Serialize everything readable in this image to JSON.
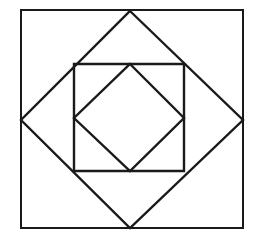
{
  "figure": {
    "background_color": "#ffffff",
    "ink_color": "#1a1a1a",
    "canvas": {
      "width": 259,
      "height": 248
    },
    "shapes": [
      {
        "name": "outer-square",
        "type": "polygon",
        "label": "Outer square",
        "stroke_width": 2.0,
        "points": "21,10 243,10 243,228 21,228"
      },
      {
        "name": "outer-diamond",
        "type": "polygon",
        "label": "Inscribed diamond (rotated square)",
        "stroke_width": 2.4,
        "points": "130,11 243,120 130,228 21,120"
      },
      {
        "name": "inner-square",
        "type": "polygon",
        "label": "Second axis-aligned square",
        "stroke_width": 2.4,
        "points": "74,64 184,64 184,171 74,171"
      },
      {
        "name": "inner-diamond",
        "type": "polygon",
        "label": "Innermost diamond (rotated square)",
        "stroke_width": 2.4,
        "points": "130,64 184,118 130,171 74,118"
      }
    ],
    "vertices": {
      "outer_square": {
        "top_left": "21,10",
        "top_right": "243,10",
        "bottom_right": "243,228",
        "bottom_left": "21,228"
      },
      "outer_diamond": {
        "top": "130,11",
        "right": "243,120",
        "bottom": "130,228",
        "left": "21,120"
      },
      "inner_square": {
        "top_left": "74,64",
        "top_right": "184,64",
        "bottom_right": "184,171",
        "bottom_left": "74,171"
      },
      "inner_diamond": {
        "top": "130,64",
        "right": "184,118",
        "bottom": "130,171",
        "left": "74,118"
      }
    }
  }
}
